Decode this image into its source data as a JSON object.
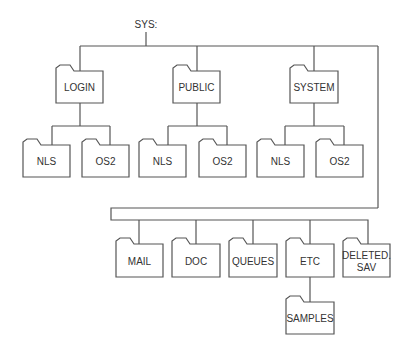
{
  "root": {
    "label": "SYS:"
  },
  "top_level": [
    {
      "label": "LOGIN",
      "children": [
        "NLS",
        "OS2"
      ]
    },
    {
      "label": "PUBLIC",
      "children": [
        "NLS",
        "OS2"
      ]
    },
    {
      "label": "SYSTEM",
      "children": [
        "NLS",
        "OS2"
      ]
    }
  ],
  "second_row": [
    {
      "label": "MAIL"
    },
    {
      "label": "DOC"
    },
    {
      "label": "QUEUES"
    },
    {
      "label": "ETC",
      "children": [
        "SAMPLES"
      ]
    },
    {
      "label_line1": "DELETED.",
      "label_line2": "SAV"
    }
  ],
  "colors": {
    "line": "#555555",
    "text": "#333333",
    "background": "#ffffff"
  }
}
